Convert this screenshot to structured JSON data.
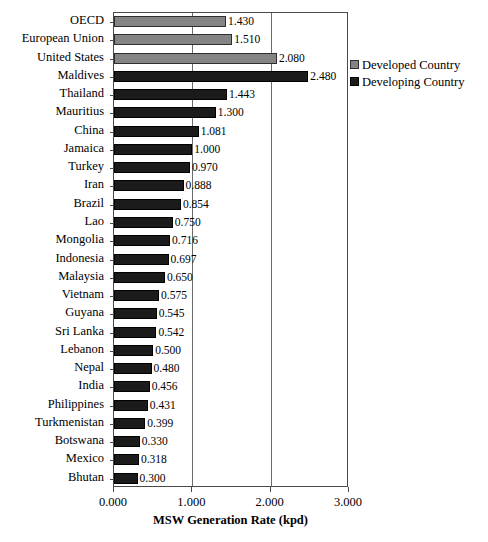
{
  "chart_data": {
    "type": "bar",
    "orientation": "horizontal",
    "title": "",
    "xlabel": "MSW Generation Rate (kpd)",
    "ylabel": "",
    "xlim": [
      0,
      3
    ],
    "xticks": [
      "0.000",
      "1.000",
      "2.000",
      "3.000"
    ],
    "xtick_values": [
      0,
      1,
      2,
      3
    ],
    "grid": "vertical",
    "legend_position": "right",
    "legend": [
      {
        "label": "Developed Country",
        "color": "#848484",
        "key": "developed"
      },
      {
        "label": "Developing Country",
        "color": "#1b1b1b",
        "key": "developing"
      }
    ],
    "categories": [
      "OECD",
      "European Union",
      "United States",
      "Maldives",
      "Thailand",
      "Mauritius",
      "China",
      "Jamaica",
      "Turkey",
      "Iran",
      "Brazil",
      "Lao",
      "Mongolia",
      "Indonesia",
      "Malaysia",
      "Vietnam",
      "Guyana",
      "Sri Lanka",
      "Lebanon",
      "Nepal",
      "India",
      "Philippines",
      "Turkmenistan",
      "Botswana",
      "Mexico",
      "Bhutan"
    ],
    "values": [
      1.43,
      1.51,
      2.08,
      2.48,
      1.443,
      1.3,
      1.081,
      1.0,
      0.97,
      0.888,
      0.854,
      0.75,
      0.716,
      0.697,
      0.65,
      0.575,
      0.545,
      0.542,
      0.5,
      0.48,
      0.456,
      0.431,
      0.399,
      0.33,
      0.318,
      0.3
    ],
    "value_labels": [
      "1.430",
      "1.510",
      "2.080",
      "2.480",
      "1.443",
      "1.300",
      "1.081",
      "1.000",
      "0.970",
      "0.888",
      "0.854",
      "0.750",
      "0.716",
      "0.697",
      "0.650",
      "0.575",
      "0.545",
      "0.542",
      "0.500",
      "0.480",
      "0.456",
      "0.431",
      "0.399",
      "0.330",
      "0.318",
      "0.300"
    ],
    "series_keys": [
      "developed",
      "developed",
      "developed",
      "developing",
      "developing",
      "developing",
      "developing",
      "developing",
      "developing",
      "developing",
      "developing",
      "developing",
      "developing",
      "developing",
      "developing",
      "developing",
      "developing",
      "developing",
      "developing",
      "developing",
      "developing",
      "developing",
      "developing",
      "developing",
      "developing",
      "developing"
    ]
  }
}
